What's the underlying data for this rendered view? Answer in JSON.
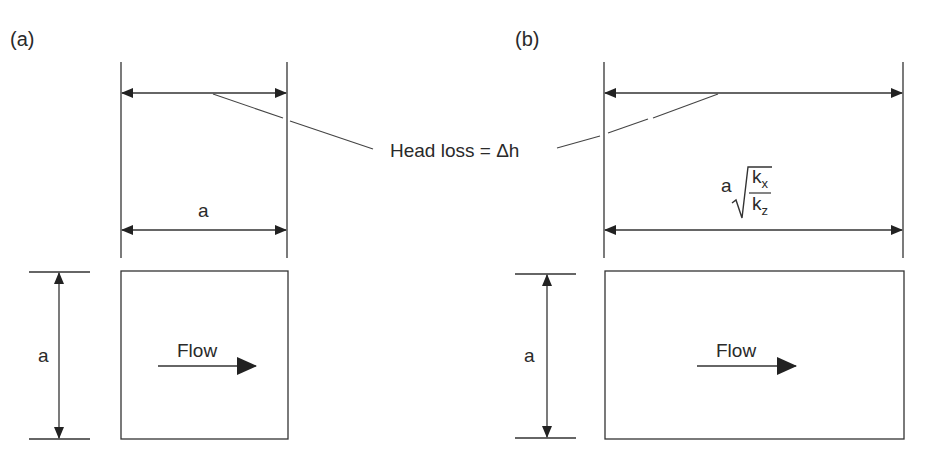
{
  "diagram": {
    "panels": [
      {
        "id": "a",
        "label": "(a)",
        "width_label": "a",
        "height_label": "a",
        "flow_label": "Flow",
        "shape": "square"
      },
      {
        "id": "b",
        "label": "(b)",
        "width_label_prefix": "a",
        "width_label_numerator": "k",
        "width_label_numerator_sub": "x",
        "width_label_denominator": "k",
        "width_label_denominator_sub": "z",
        "width_label_full": "a √(kx / kz)",
        "height_label": "a",
        "flow_label": "Flow",
        "shape": "rectangle"
      }
    ],
    "shared_annotation": "Head loss = Δh",
    "colors": {
      "line": "#2a2a2a",
      "background": "#ffffff"
    }
  }
}
